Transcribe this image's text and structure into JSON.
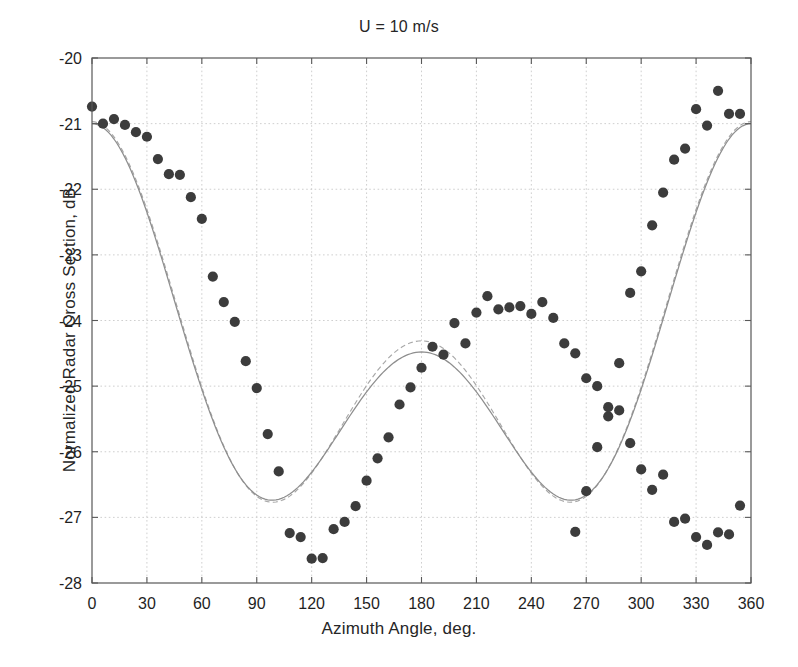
{
  "chart_data": {
    "type": "scatter",
    "title": "U = 10 m/s",
    "xlabel": "Azimuth Angle, deg.",
    "ylabel": "Normalized Radar Cross Section, dB",
    "xlim": [
      0,
      360
    ],
    "ylim": [
      -28,
      -20
    ],
    "xticks": [
      0,
      30,
      60,
      90,
      120,
      150,
      180,
      210,
      240,
      270,
      300,
      330,
      360
    ],
    "yticks": [
      -28,
      -27,
      -26,
      -25,
      -24,
      -23,
      -22,
      -21,
      -20
    ],
    "xtick_labels": [
      "0",
      "30",
      "60",
      "90",
      "120",
      "150",
      "180",
      "210",
      "240",
      "270",
      "300",
      "330",
      "360"
    ],
    "ytick_labels": [
      "-28",
      "-27",
      "-26",
      "-25",
      "-24",
      "-23",
      "-22",
      "-21",
      "-20"
    ],
    "grid": true,
    "grid_style": "dotted",
    "legend": null,
    "marker_color": "#3c3c3c",
    "curve_color": "#8e8e8e",
    "series": [
      {
        "name": "measured",
        "kind": "scatter",
        "marker": "filled-circle",
        "x": [
          0,
          6,
          12,
          18,
          24,
          30,
          36,
          42,
          48,
          54,
          60,
          66,
          72,
          78,
          84,
          90,
          96,
          102,
          108,
          114,
          120,
          126,
          132,
          138,
          144,
          150,
          156,
          162,
          168,
          174,
          180,
          186,
          192,
          198,
          204,
          210,
          216,
          222,
          228,
          234,
          240,
          246,
          252,
          258,
          264,
          270,
          276,
          282,
          288,
          294,
          300,
          306,
          312,
          318,
          324,
          330,
          336,
          342,
          348,
          354
        ],
        "y": [
          -20.74,
          -21.0,
          -20.93,
          -21.02,
          -21.13,
          -21.2,
          -21.54,
          -21.77,
          -21.78,
          -22.12,
          -22.45,
          -23.33,
          -23.72,
          -24.02,
          -24.62,
          -25.03,
          -25.73,
          -26.3,
          -27.24,
          -27.3,
          -27.63,
          -27.62,
          -27.18,
          -27.07,
          -26.83,
          -26.44,
          -26.1,
          -25.78,
          -25.28,
          -25.02,
          -24.72,
          -24.4,
          -24.52,
          -24.04,
          -24.35,
          -23.88,
          -23.63,
          -23.83,
          -23.8,
          -23.78,
          -23.9,
          -23.72,
          -23.96,
          -24.35,
          -24.5,
          -24.88,
          -25.0,
          -25.46,
          -25.37,
          -25.87,
          -26.27,
          -26.58,
          -26.35,
          -27.07,
          -27.02,
          -27.3,
          -27.42,
          -27.23,
          -27.26,
          -26.82
        ]
      },
      {
        "name": "measured-second-half",
        "kind": "scatter",
        "marker": "filled-circle",
        "x": [
          264,
          270,
          276,
          282,
          288,
          294,
          300,
          306,
          312,
          318,
          324,
          330,
          336,
          342,
          348,
          354
        ],
        "y": [
          -27.22,
          -26.6,
          -25.93,
          -25.32,
          -24.65,
          -23.58,
          -23.25,
          -22.55,
          -22.05,
          -21.55,
          -21.38,
          -20.78,
          -21.03,
          -20.5,
          -20.85,
          -20.85
        ]
      },
      {
        "name": "model",
        "kind": "line",
        "style": "solid",
        "description": "smooth fitted cosine model curve"
      },
      {
        "name": "fit",
        "kind": "line",
        "style": "dashed",
        "description": "dashed second fitted curve, nearly overlapping model"
      }
    ],
    "annotations": {
      "first_minimum_deg": 100,
      "first_minimum_db": -27.55,
      "central_maximum_deg": 183,
      "central_maximum_db": -23.63,
      "second_minimum_deg": 256,
      "second_minimum_db": -27.4,
      "left_edge_db": -20.75,
      "right_edge_db": -20.6
    }
  }
}
